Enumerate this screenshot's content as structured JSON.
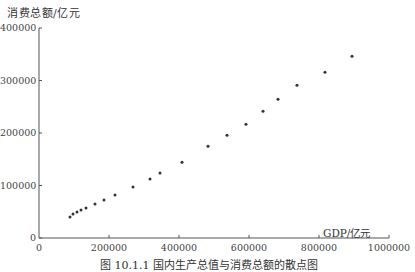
{
  "chart_data": {
    "type": "scatter",
    "title": "",
    "caption": "图 10.1.1   国内生产总值与消费总额的散点图",
    "xlabel": "GDP/亿元",
    "ylabel": "消费总额/亿元",
    "xlim": [
      0,
      1000000
    ],
    "ylim": [
      0,
      400000
    ],
    "xticks": [
      0,
      200000,
      400000,
      600000,
      800000,
      1000000
    ],
    "xtick_labels": [
      "0",
      "200000",
      "400000",
      "600000",
      "800000",
      "1000000"
    ],
    "yticks": [
      0,
      100000,
      200000,
      300000,
      400000
    ],
    "ytick_labels": [
      "0",
      "100000",
      "200000",
      "300000",
      "400000"
    ],
    "grid": false,
    "legend": null,
    "series": [
      {
        "name": "GDP vs 消费总额",
        "marker": "dot",
        "color": "#333333",
        "points": [
          {
            "x": 88600,
            "y": 39900
          },
          {
            "x": 97100,
            "y": 45600
          },
          {
            "x": 108600,
            "y": 49400
          },
          {
            "x": 120000,
            "y": 53200
          },
          {
            "x": 134300,
            "y": 57000
          },
          {
            "x": 160000,
            "y": 64600
          },
          {
            "x": 185700,
            "y": 72200
          },
          {
            "x": 217100,
            "y": 81700
          },
          {
            "x": 268600,
            "y": 97000
          },
          {
            "x": 317100,
            "y": 112200
          },
          {
            "x": 345700,
            "y": 123600
          },
          {
            "x": 408600,
            "y": 144500
          },
          {
            "x": 482900,
            "y": 174900
          },
          {
            "x": 537100,
            "y": 195800
          },
          {
            "x": 591400,
            "y": 216700
          },
          {
            "x": 640000,
            "y": 241400
          },
          {
            "x": 682900,
            "y": 264200
          },
          {
            "x": 737100,
            "y": 290900
          },
          {
            "x": 817100,
            "y": 315600
          },
          {
            "x": 894300,
            "y": 346000
          }
        ]
      }
    ]
  }
}
